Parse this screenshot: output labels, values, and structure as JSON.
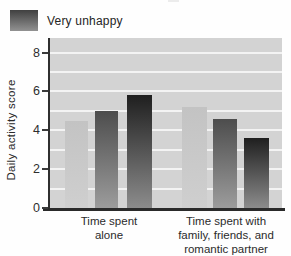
{
  "legend": {
    "items": [
      {
        "label": "Very unhappy",
        "swatch_top": "#404040",
        "swatch_bottom": "#929292"
      }
    ]
  },
  "chart_data": {
    "type": "bar",
    "title": "",
    "xlabel": "",
    "ylabel": "Daily activity score",
    "ylim": [
      0,
      8.75
    ],
    "yticks": [
      0,
      2,
      4,
      6,
      8
    ],
    "gridlines_at": [
      1,
      2,
      3,
      4,
      5,
      6,
      7,
      8
    ],
    "grid": true,
    "legend_position": "top-left",
    "categories": [
      "Time spent\nalone",
      "Time spent with\nfamily, friends, and\nromantic partner"
    ],
    "series": [
      {
        "name": "light-gray-bar",
        "values": [
          4.5,
          5.2
        ],
        "color_top": "#c3c3c3",
        "color_bottom": "#cfcfcf"
      },
      {
        "name": "medium-gray-bar",
        "values": [
          5.0,
          4.6
        ],
        "color_top": "#4d4d4d",
        "color_bottom": "#9c9c9c"
      },
      {
        "name": "dark-gray-bar-very-unhappy",
        "values": [
          5.8,
          3.6
        ],
        "color_top": "#1f1f1f",
        "color_bottom": "#8c8c8c"
      }
    ],
    "colors": {
      "plot_bg": "#d3d3d3",
      "gridline": "#f3f3f3",
      "axis": "#2a2a2a",
      "text": "#2b2b2b"
    }
  }
}
